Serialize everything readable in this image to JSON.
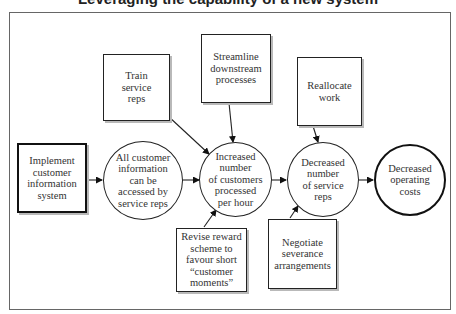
{
  "title": "Leveraging the capability of a new system",
  "nodes": {
    "implement": {
      "label": "Implement\ncustomer\ninformation\nsystem",
      "shape": "box",
      "emphasis": "thick"
    },
    "all_info": {
      "label": "All customer\ninformation\ncan be\naccessed by\nservice reps",
      "shape": "circle"
    },
    "increased": {
      "label": "Increased\nnumber\nof customers\nprocessed\nper hour",
      "shape": "circle"
    },
    "decreased_reps": {
      "label": "Decreased\nnumber\nof service\nreps",
      "shape": "circle"
    },
    "decreased_costs": {
      "label": "Decreased\noperating\ncosts",
      "shape": "circle",
      "emphasis": "thick"
    },
    "train": {
      "label": "Train\nservice\nreps",
      "shape": "box"
    },
    "streamline": {
      "label": "Streamline\ndownstream\nprocesses",
      "shape": "box"
    },
    "reallocate": {
      "label": "Reallocate\nwork",
      "shape": "box"
    },
    "revise": {
      "label": "Revise reward\nscheme to\nfavour short\n“customer\nmoments”",
      "shape": "box"
    },
    "negotiate": {
      "label": "Negotiate\nseverance\narrangements",
      "shape": "box"
    }
  },
  "edges": [
    {
      "from": "implement",
      "to": "all_info"
    },
    {
      "from": "all_info",
      "to": "increased"
    },
    {
      "from": "train",
      "to": "increased"
    },
    {
      "from": "streamline",
      "to": "increased"
    },
    {
      "from": "revise",
      "to": "increased"
    },
    {
      "from": "increased",
      "to": "decreased_reps"
    },
    {
      "from": "reallocate",
      "to": "decreased_reps"
    },
    {
      "from": "negotiate",
      "to": "decreased_reps"
    },
    {
      "from": "decreased_reps",
      "to": "decreased_costs"
    }
  ]
}
